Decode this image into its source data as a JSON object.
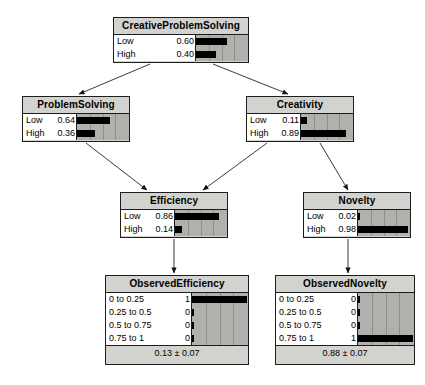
{
  "diagram": {
    "type": "bayesian-network",
    "title": "",
    "background": "#ffffff",
    "node_fill": "#d2d2cf",
    "bar_area_fill": "#b0b0ad",
    "bar_fill": "#000000",
    "border_color": "#1d1d1d"
  },
  "nodes": [
    {
      "id": "CreativeProblemSolving",
      "title": "CreativeProblemSolving",
      "x": 113,
      "y": 17,
      "width": 136,
      "height": 46,
      "label_width": 40,
      "bar_width": 52,
      "gridlines": 4,
      "states": [
        {
          "label": "Low",
          "value": "0.60",
          "fraction": 0.6
        },
        {
          "label": "High",
          "value": "0.40",
          "fraction": 0.4
        }
      ],
      "footer": null
    },
    {
      "id": "ProblemSolving",
      "title": "ProblemSolving",
      "x": 22,
      "y": 96,
      "width": 108,
      "height": 46,
      "label_width": 26,
      "bar_width": 52,
      "gridlines": 4,
      "states": [
        {
          "label": "Low",
          "value": "0.64",
          "fraction": 0.64
        },
        {
          "label": "High",
          "value": "0.36",
          "fraction": 0.36
        }
      ],
      "footer": null
    },
    {
      "id": "Creativity",
      "title": "Creativity",
      "x": 246,
      "y": 96,
      "width": 108,
      "height": 46,
      "label_width": 26,
      "bar_width": 52,
      "gridlines": 4,
      "states": [
        {
          "label": "Low",
          "value": "0.11",
          "fraction": 0.11
        },
        {
          "label": "High",
          "value": "0.89",
          "fraction": 0.89
        }
      ],
      "footer": null
    },
    {
      "id": "Efficiency",
      "title": "Efficiency",
      "x": 120,
      "y": 192,
      "width": 108,
      "height": 46,
      "label_width": 26,
      "bar_width": 52,
      "gridlines": 4,
      "states": [
        {
          "label": "Low",
          "value": "0.86",
          "fraction": 0.86
        },
        {
          "label": "High",
          "value": "0.14",
          "fraction": 0.14
        }
      ],
      "footer": null
    },
    {
      "id": "Novelty",
      "title": "Novelty",
      "x": 303,
      "y": 192,
      "width": 108,
      "height": 46,
      "label_width": 26,
      "bar_width": 52,
      "gridlines": 4,
      "states": [
        {
          "label": "Low",
          "value": "0.02",
          "fraction": 0.02
        },
        {
          "label": "High",
          "value": "0.98",
          "fraction": 0.98
        }
      ],
      "footer": null
    },
    {
      "id": "ObservedEfficiency",
      "title": "ObservedEfficiency",
      "x": 105,
      "y": 275,
      "width": 144,
      "height": 90,
      "label_width": 58,
      "bar_width": 56,
      "gridlines": 4,
      "states": [
        {
          "label": "0 to 0.25",
          "value": "1",
          "fraction": 1.0
        },
        {
          "label": "0.25 to 0.5",
          "value": "0",
          "fraction": 0.0
        },
        {
          "label": "0.5 to 0.75",
          "value": "0",
          "fraction": 0.0
        },
        {
          "label": "0.75 to 1",
          "value": "0",
          "fraction": 0.0
        }
      ],
      "footer": "0.13 ± 0.07"
    },
    {
      "id": "ObservedNovelty",
      "title": "ObservedNovelty",
      "x": 275,
      "y": 275,
      "width": 140,
      "height": 90,
      "label_width": 58,
      "bar_width": 56,
      "gridlines": 4,
      "states": [
        {
          "label": "0 to 0.25",
          "value": "0",
          "fraction": 0.0
        },
        {
          "label": "0.25 to 0.5",
          "value": "0",
          "fraction": 0.0
        },
        {
          "label": "0.5 to 0.75",
          "value": "0",
          "fraction": 0.0
        },
        {
          "label": "0.75 to 1",
          "value": "1",
          "fraction": 1.0
        }
      ],
      "footer": "0.88 ± 0.07"
    }
  ],
  "edges": [
    {
      "from": "CreativeProblemSolving",
      "to": "ProblemSolving",
      "x1": 150,
      "y1": 64,
      "x2": 79,
      "y2": 94
    },
    {
      "from": "CreativeProblemSolving",
      "to": "Creativity",
      "x1": 213,
      "y1": 64,
      "x2": 288,
      "y2": 94
    },
    {
      "from": "ProblemSolving",
      "to": "Efficiency",
      "x1": 86,
      "y1": 143,
      "x2": 147,
      "y2": 190
    },
    {
      "from": "Creativity",
      "to": "Efficiency",
      "x1": 267,
      "y1": 143,
      "x2": 203,
      "y2": 190
    },
    {
      "from": "Creativity",
      "to": "Novelty",
      "x1": 320,
      "y1": 143,
      "x2": 348,
      "y2": 190
    },
    {
      "from": "Efficiency",
      "to": "ObservedEfficiency",
      "x1": 174,
      "y1": 239,
      "x2": 174,
      "y2": 273
    },
    {
      "from": "Novelty",
      "to": "ObservedNovelty",
      "x1": 348,
      "y1": 239,
      "x2": 348,
      "y2": 273
    }
  ]
}
